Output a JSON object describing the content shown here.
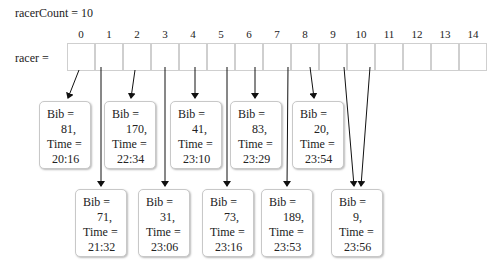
{
  "labels": {
    "racer_count": "racerCount = 10",
    "racer": "racer ="
  },
  "array": {
    "indices": [
      "0",
      "1",
      "2",
      "3",
      "4",
      "5",
      "6",
      "7",
      "8",
      "9",
      "10",
      "11",
      "12",
      "13",
      "14"
    ]
  },
  "nodes": [
    {
      "index": 0,
      "bib_label": "Bib =",
      "bib": "81,",
      "time_label": "Time =",
      "time": "20:16"
    },
    {
      "index": 1,
      "bib_label": "Bib =",
      "bib": "71,",
      "time_label": "Time =",
      "time": "21:32"
    },
    {
      "index": 2,
      "bib_label": "Bib =",
      "bib": "170,",
      "time_label": "Time =",
      "time": "22:34"
    },
    {
      "index": 3,
      "bib_label": "Bib =",
      "bib": "31,",
      "time_label": "Time =",
      "time": "23:06"
    },
    {
      "index": 4,
      "bib_label": "Bib =",
      "bib": "41,",
      "time_label": "Time =",
      "time": "23:10"
    },
    {
      "index": 5,
      "bib_label": "Bib =",
      "bib": "73,",
      "time_label": "Time =",
      "time": "23:16"
    },
    {
      "index": 6,
      "bib_label": "Bib =",
      "bib": "83,",
      "time_label": "Time =",
      "time": "23:29"
    },
    {
      "index": 7,
      "bib_label": "Bib =",
      "bib": "189,",
      "time_label": "Time =",
      "time": "23:53"
    },
    {
      "index": 8,
      "bib_label": "Bib =",
      "bib": "20,",
      "time_label": "Time =",
      "time": "23:54"
    },
    {
      "index": 9,
      "bib_label": "Bib =",
      "bib": "9,",
      "time_label": "Time =",
      "time": "23:56"
    }
  ]
}
